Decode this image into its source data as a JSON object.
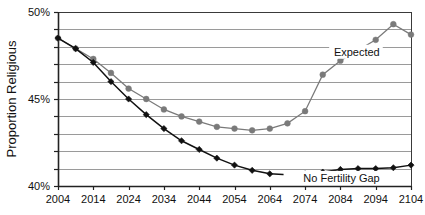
{
  "chart_data": {
    "type": "line",
    "title": "",
    "xlabel": "",
    "ylabel": "Proportion Religious",
    "x": [
      2004,
      2009,
      2014,
      2019,
      2024,
      2029,
      2034,
      2039,
      2044,
      2049,
      2054,
      2059,
      2064,
      2069,
      2074,
      2079,
      2084,
      2089,
      2094,
      2099,
      2104
    ],
    "xlim": [
      2004,
      2104
    ],
    "ylim": [
      40,
      50
    ],
    "ytick_labels": [
      "40%",
      "45%",
      "50%"
    ],
    "ytick_values": [
      40,
      45,
      50
    ],
    "xtick_labels": [
      "2004",
      "2014",
      "2024",
      "2034",
      "2044",
      "2054",
      "2064",
      "2074",
      "2084",
      "2094",
      "2104"
    ],
    "xtick_values": [
      2004,
      2014,
      2024,
      2034,
      2044,
      2054,
      2064,
      2074,
      2084,
      2094,
      2104
    ],
    "grid": true,
    "grid_interval": 1,
    "legend_position": "inline-annotation",
    "series": [
      {
        "name": "Expected",
        "marker": "circle",
        "color": "#7a7a7a",
        "label_x": 2096,
        "label_y": 47.6,
        "values": [
          48.5,
          47.9,
          47.3,
          46.5,
          45.6,
          45.0,
          44.4,
          44.0,
          43.7,
          43.4,
          43.3,
          43.2,
          43.3,
          43.6,
          44.3,
          46.4,
          47.2,
          47.8,
          48.4,
          49.3,
          48.7
        ]
      },
      {
        "name": "No Fertility Gap",
        "marker": "diamond",
        "color": "#111111",
        "label_x": 2096,
        "label_y": 40.35,
        "values": [
          48.5,
          47.9,
          47.1,
          46.0,
          45.0,
          44.1,
          43.3,
          42.6,
          42.1,
          41.6,
          41.2,
          40.9,
          40.7,
          40.65,
          40.7,
          40.8,
          40.95,
          41.0,
          41.0,
          41.05,
          41.2
        ]
      }
    ]
  },
  "colors": {
    "expected": "#7a7a7a",
    "no_fertility_gap": "#111111",
    "grid": "#9a9a9a",
    "axis": "#3a3a3a",
    "background": "#ffffff"
  }
}
